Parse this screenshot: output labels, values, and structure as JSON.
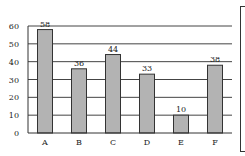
{
  "chart_data": {
    "type": "bar",
    "title": "",
    "xlabel": "",
    "ylabel": "",
    "categories": [
      "A",
      "B",
      "C",
      "D",
      "E",
      "F"
    ],
    "values": [
      58,
      36,
      44,
      33,
      10,
      38
    ],
    "data_labels": [
      "58",
      "36",
      "44",
      "33",
      "10",
      "38"
    ],
    "ylim": [
      0,
      60
    ],
    "yticks": [
      0,
      10,
      20,
      30,
      40,
      50,
      60
    ],
    "ytick_labels": [
      "0",
      "10",
      "20",
      "30",
      "40",
      "50",
      "60"
    ],
    "grid": true,
    "legend_position": "right (empty box, partially cropped)",
    "bar_color": "#b3b3b3",
    "bar_edge_color": "#333333"
  }
}
